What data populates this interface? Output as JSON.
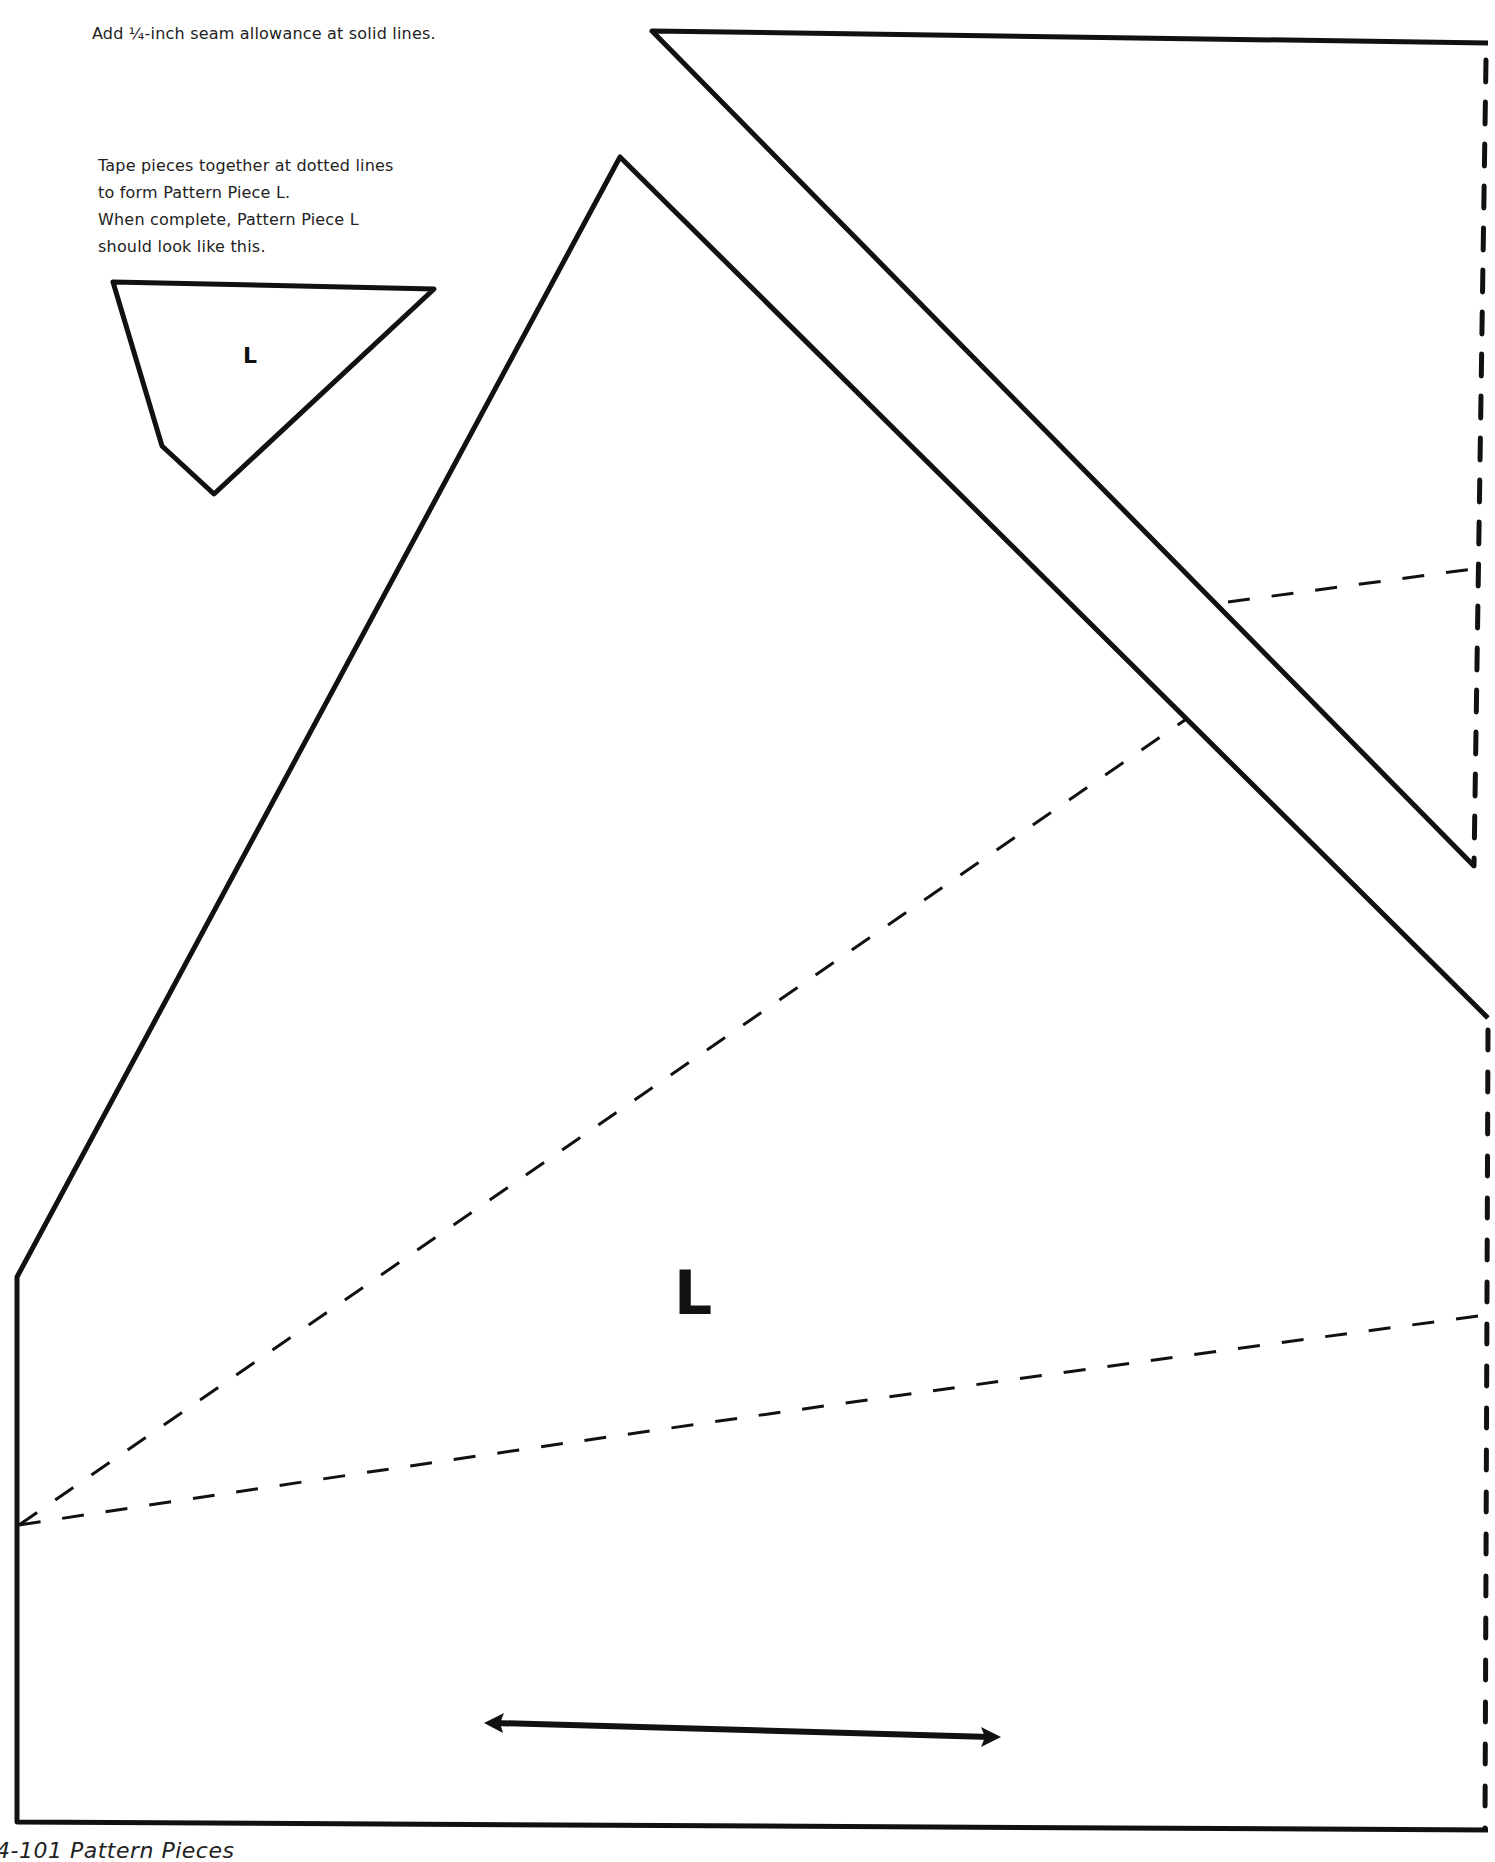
{
  "instructions": {
    "seam_allowance": "Add ¼-inch seam allowance at solid lines.",
    "tape_lines": [
      "Tape pieces together at dotted lines",
      "to form Pattern Piece L.",
      "When complete, Pattern Piece L",
      "should look like this."
    ]
  },
  "preview_piece": {
    "label": "L"
  },
  "main_piece": {
    "label": "L",
    "grainline": "double-headed arrow"
  },
  "caption": "4-101  Pattern Pieces",
  "colors": {
    "line": "#111111",
    "background": "#ffffff",
    "text": "#222222"
  }
}
